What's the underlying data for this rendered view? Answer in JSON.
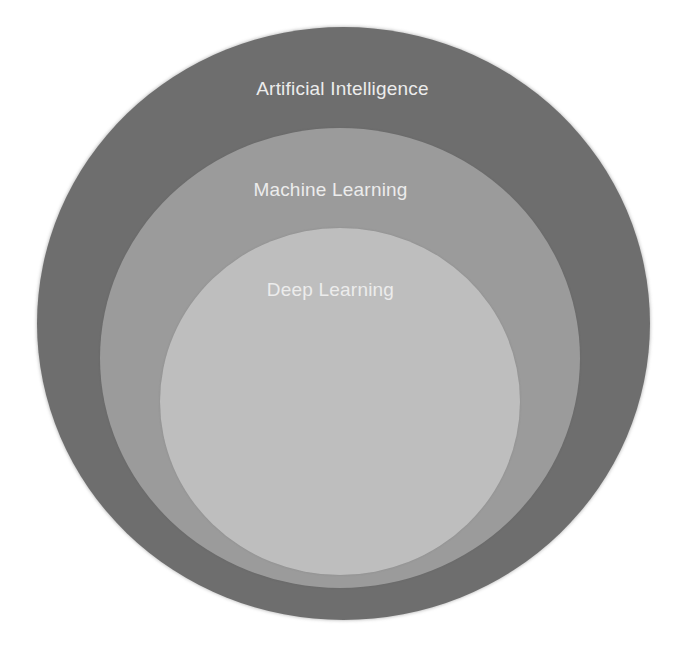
{
  "diagram": {
    "type": "nested-venn",
    "colors": {
      "background": "#ffffff",
      "outer_circle": "#6e6e6e",
      "middle_circle": "#9b9b9b",
      "inner_circle": "#bebebe",
      "label_text": "#ececec"
    },
    "circles": [
      {
        "id": "ai",
        "label": "Artificial Intelligence",
        "level": "outer"
      },
      {
        "id": "ml",
        "label": "Machine Learning",
        "level": "middle"
      },
      {
        "id": "dl",
        "label": "Deep Learning",
        "level": "inner"
      }
    ]
  }
}
